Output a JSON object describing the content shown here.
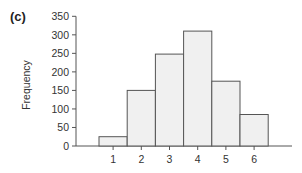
{
  "panel_label": "(c)",
  "chart_data": {
    "type": "bar",
    "title": "",
    "panel_label": "(c)",
    "xlabel": "",
    "ylabel": "Frequency",
    "categories": [
      "1",
      "2",
      "3",
      "4",
      "5",
      "6"
    ],
    "values": [
      25,
      150,
      248,
      310,
      175,
      85
    ],
    "ylim": [
      0,
      350
    ],
    "yticks": [
      0,
      50,
      100,
      150,
      200,
      250,
      300,
      350
    ],
    "xticks": [
      "1",
      "2",
      "3",
      "4",
      "5",
      "6"
    ],
    "grid": false,
    "legend": null,
    "bar_style": "histogram (adjacent bars, no gaps)",
    "bar_fill": "#f0f0f0",
    "bar_edge": "#555555"
  },
  "layout": {
    "plot": {
      "x0": 76,
      "y0": 146,
      "y_top": 16.3,
      "x_axis_end": 292
    },
    "bar": {
      "first_left": 99,
      "width": 28.2
    }
  }
}
